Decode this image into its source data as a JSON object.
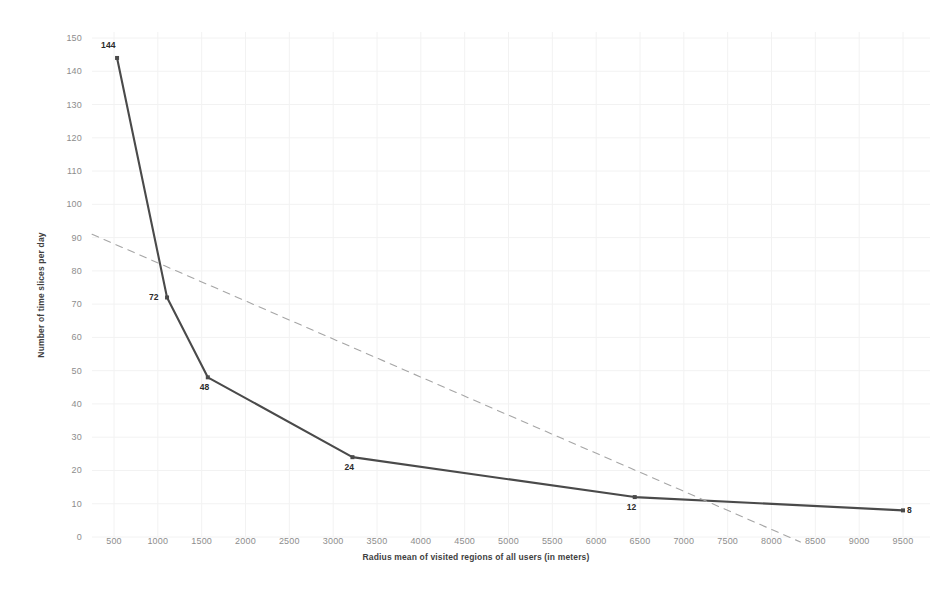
{
  "chart_data": {
    "type": "line",
    "title": "",
    "xlabel": "Radius mean of visited regions of all users (in meters)",
    "ylabel": "Number of time slices per day",
    "xlim": [
      0,
      9800
    ],
    "ylim": [
      0,
      150
    ],
    "grid": true,
    "legend": "none",
    "x_ticks": [
      "500",
      "1000",
      "1500",
      "2000",
      "2500",
      "3000",
      "3500",
      "4000",
      "4500",
      "5000",
      "5500",
      "6000",
      "6500",
      "7000",
      "7500",
      "8000",
      "8500",
      "9000",
      "9500"
    ],
    "y_ticks": [
      "0",
      "10",
      "20",
      "30",
      "40",
      "50",
      "60",
      "70",
      "80",
      "90",
      "100",
      "110",
      "120",
      "130",
      "140",
      "150"
    ],
    "series": [
      {
        "name": "Number of time slices per day",
        "style": "solid",
        "color": "#4a4a4a",
        "marker": "square",
        "show_labels": true,
        "points": [
          {
            "x": 535,
            "y": 144,
            "label": "144"
          },
          {
            "x": 1105,
            "y": 72,
            "label": "72"
          },
          {
            "x": 1570,
            "y": 48,
            "label": "48"
          },
          {
            "x": 3220,
            "y": 24,
            "label": "24"
          },
          {
            "x": 6440,
            "y": 12,
            "label": "12"
          },
          {
            "x": 9500,
            "y": 8,
            "label": "8"
          }
        ]
      },
      {
        "name": "trendline",
        "style": "dashed",
        "color": "#a6a6a6",
        "marker": "none",
        "show_labels": false,
        "points": [
          {
            "x": 250,
            "y": 91,
            "label": ""
          },
          {
            "x": 8330,
            "y": -1.5,
            "label": ""
          }
        ]
      }
    ]
  },
  "colors": {
    "series_line": "#4a4a4a",
    "trendline": "#a6a6a6",
    "tick_text": "#8d8d8d",
    "axis_title_text": "#3f3f3f",
    "grid": "#f2f2f2",
    "background": "#ffffff"
  }
}
